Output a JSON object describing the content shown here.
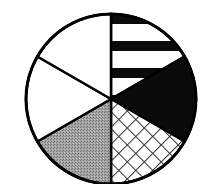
{
  "chart_data": {
    "type": "pie",
    "title": "",
    "center": [
      111,
      99
    ],
    "radius": 85,
    "start_angle_deg": 0,
    "direction": "clockwise",
    "slices": [
      {
        "label": "",
        "value": 60,
        "fill": "horizontal-stripes"
      },
      {
        "label": "",
        "value": 60,
        "fill": "solid-black"
      },
      {
        "label": "",
        "value": 60,
        "fill": "crosshatch"
      },
      {
        "label": "",
        "value": 60,
        "fill": "gray-stipple"
      },
      {
        "label": "",
        "value": 60,
        "fill": "white"
      },
      {
        "label": "",
        "value": 60,
        "fill": "white"
      }
    ],
    "values": [
      60,
      60,
      60,
      60,
      60,
      60
    ],
    "categories": [
      "",
      "",
      "",
      "",
      "",
      ""
    ],
    "legend": null
  },
  "colors": {
    "outline": "#000000",
    "black": "#0a0a0a",
    "gray": "#9a9a9a",
    "white": "#ffffff",
    "hatch": "#333333"
  }
}
